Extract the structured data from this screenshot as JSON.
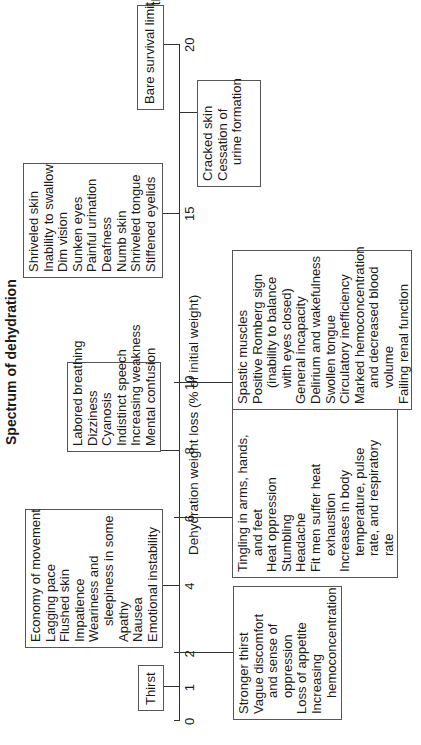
{
  "title": "Spectrum of dehydration",
  "axis": {
    "label": "Dehydration weight loss (% of initial weight)",
    "ticks": [
      "0",
      "1",
      "2",
      "4",
      "6",
      "8",
      "10",
      "15",
      "20"
    ],
    "end_label": "Death"
  },
  "boxes": {
    "thirst": {
      "tick": 1,
      "lines": [
        {
          "t": "Thirst"
        }
      ]
    },
    "at2": {
      "tick": 2,
      "lines": [
        {
          "t": "Stronger thirst"
        },
        {
          "t": "Vague discomfort"
        },
        {
          "t": "and sense of",
          "i": 1
        },
        {
          "t": "oppression",
          "i": 1
        },
        {
          "t": "Loss of appetite"
        },
        {
          "t": "Increasing"
        },
        {
          "t": "hemoconcentration",
          "i": 1
        }
      ]
    },
    "at4": {
      "tick": 4,
      "lines": [
        {
          "t": "Economy of movement"
        },
        {
          "t": "Lagging pace"
        },
        {
          "t": "Flushed skin"
        },
        {
          "t": "Impatience"
        },
        {
          "t": "Weariness and"
        },
        {
          "t": "sleepiness in some",
          "i": 1
        },
        {
          "t": "Apathy"
        },
        {
          "t": "Nausea"
        },
        {
          "t": "Emotional instability"
        }
      ]
    },
    "at6": {
      "tick": 6,
      "lines": [
        {
          "t": "Tingling in arms, hands,"
        },
        {
          "t": "and feet",
          "i": 1
        },
        {
          "t": "Heat oppression"
        },
        {
          "t": "Stumbling"
        },
        {
          "t": "Headache"
        },
        {
          "t": "Fit men suffer heat"
        },
        {
          "t": "exhaustion",
          "i": 1
        },
        {
          "t": "Increases in body"
        },
        {
          "t": "temperature, pulse",
          "i": 1
        },
        {
          "t": "rate, and respiratory",
          "i": 1
        },
        {
          "t": "rate",
          "i": 1
        }
      ]
    },
    "at8": {
      "tick": 8,
      "lines": [
        {
          "t": "Labored breathing"
        },
        {
          "t": "Dizziness"
        },
        {
          "t": "Cyanosis"
        },
        {
          "t": "Indistinct speech"
        },
        {
          "t": "Increasing weakness"
        },
        {
          "t": "Mental confusion"
        }
      ]
    },
    "at10": {
      "tick": 10,
      "lines": [
        {
          "t": "Spastic muscles"
        },
        {
          "t": "Positive Romberg sign"
        },
        {
          "t": "(inability to balance",
          "i": 1
        },
        {
          "t": "with eyes closed)",
          "i": 1
        },
        {
          "t": "General incapacity"
        },
        {
          "t": "Delirium and wakefulness"
        },
        {
          "t": "Swollen tongue"
        },
        {
          "t": "Circulatory inefficiency"
        },
        {
          "t": "Marked hemoconcentration"
        },
        {
          "t": "and decreased blood",
          "i": 1
        },
        {
          "t": "volume",
          "i": 1
        },
        {
          "t": "Failing renal function"
        }
      ]
    },
    "at15": {
      "tick": 15,
      "lines": [
        {
          "t": "Shriveled skin"
        },
        {
          "t": "Inability to swallow"
        },
        {
          "t": "Dim vision"
        },
        {
          "t": "Sunken eyes"
        },
        {
          "t": "Painful urination"
        },
        {
          "t": "Deafness"
        },
        {
          "t": "Numb skin"
        },
        {
          "t": "Shriveled tongue"
        },
        {
          "t": "Stiffened eyelids"
        }
      ]
    },
    "at18": {
      "tick": 18,
      "lines": [
        {
          "t": "Cracked skin"
        },
        {
          "t": "Cessation of"
        },
        {
          "t": "urine formation",
          "i": 1
        }
      ]
    },
    "at20": {
      "tick": 20,
      "lines": [
        {
          "t": "Bare survival limit"
        }
      ]
    }
  }
}
